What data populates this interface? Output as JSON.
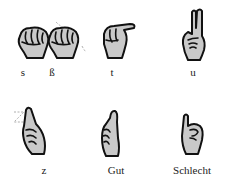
{
  "figure": {
    "background": "#ffffff",
    "signs": [
      {
        "label": "s",
        "icon": "fist-hand-icon"
      },
      {
        "label": "ß",
        "icon": "fist-hand-motion-icon"
      },
      {
        "label": "t",
        "icon": "thumb-between-fingers-hand-icon"
      },
      {
        "label": "u",
        "icon": "two-fingers-up-hand-icon"
      },
      {
        "label": "z",
        "icon": "index-finger-zigzag-hand-icon"
      },
      {
        "label": "Gut",
        "icon": "thumbs-up-hand-icon"
      },
      {
        "label": "Schlecht",
        "icon": "pinky-up-hand-icon"
      }
    ]
  }
}
